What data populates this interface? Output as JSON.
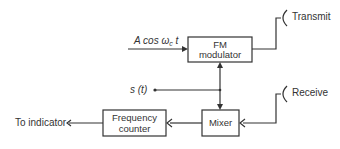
{
  "diagram": {
    "blocks": {
      "fm_modulator": {
        "line1": "FM",
        "line2": "modulator"
      },
      "mixer": {
        "line1": "Mixer"
      },
      "frequency_counter": {
        "line1": "Frequency",
        "line2": "counter"
      }
    },
    "signals": {
      "carrier": {
        "prefix": "A cos ω",
        "subscript": "c",
        "suffix": " t"
      },
      "modulating": {
        "text": "s (t)"
      }
    },
    "antennas": {
      "transmit": "Transmit",
      "receive": "Receive"
    },
    "output": {
      "label": "To indicator"
    }
  }
}
